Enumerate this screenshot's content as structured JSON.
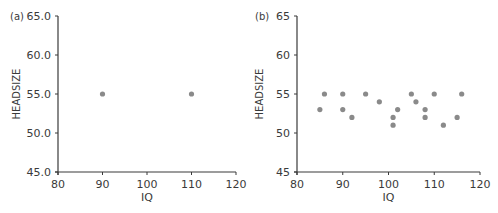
{
  "chart_data": [
    {
      "type": "scatter",
      "panel_label": "(a)",
      "title": "",
      "xlabel": "IQ",
      "ylabel": "HEADSIZE",
      "xlim": [
        80,
        120
      ],
      "ylim": [
        45,
        65
      ],
      "xticks": [
        80,
        90,
        100,
        110,
        120
      ],
      "xtick_labels": [
        "80",
        "90",
        "100",
        "110",
        "120"
      ],
      "yticks": [
        45,
        50,
        55,
        60,
        65
      ],
      "ytick_labels": [
        "45.0",
        "50.0",
        "55.0",
        "60.0",
        "65.0"
      ],
      "grid": false,
      "legend": null,
      "marker_color": "#8a8a8a",
      "points": [
        {
          "x": 90,
          "y": 55
        },
        {
          "x": 110,
          "y": 55
        }
      ]
    },
    {
      "type": "scatter",
      "panel_label": "(b)",
      "title": "",
      "xlabel": "IQ",
      "ylabel": "HEADSIZE",
      "xlim": [
        80,
        120
      ],
      "ylim": [
        45,
        65
      ],
      "xticks": [
        80,
        90,
        100,
        110,
        120
      ],
      "xtick_labels": [
        "80",
        "90",
        "100",
        "110",
        "120"
      ],
      "yticks": [
        45,
        50,
        55,
        60,
        65
      ],
      "ytick_labels": [
        "45",
        "50",
        "55",
        "60",
        "65"
      ],
      "grid": false,
      "legend": null,
      "marker_color": "#8a8a8a",
      "points": [
        {
          "x": 85,
          "y": 53
        },
        {
          "x": 86,
          "y": 55
        },
        {
          "x": 90,
          "y": 55
        },
        {
          "x": 90,
          "y": 53
        },
        {
          "x": 92,
          "y": 52
        },
        {
          "x": 95,
          "y": 55
        },
        {
          "x": 98,
          "y": 54
        },
        {
          "x": 101,
          "y": 52
        },
        {
          "x": 101,
          "y": 51
        },
        {
          "x": 102,
          "y": 53
        },
        {
          "x": 105,
          "y": 55
        },
        {
          "x": 106,
          "y": 54
        },
        {
          "x": 108,
          "y": 53
        },
        {
          "x": 108,
          "y": 52
        },
        {
          "x": 110,
          "y": 55
        },
        {
          "x": 112,
          "y": 51
        },
        {
          "x": 115,
          "y": 52
        },
        {
          "x": 116,
          "y": 55
        }
      ]
    }
  ]
}
